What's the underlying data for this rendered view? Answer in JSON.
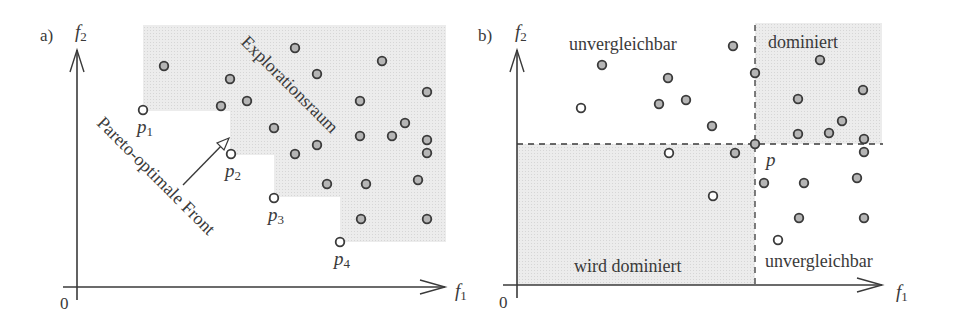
{
  "panel_a": {
    "label": "a)",
    "y_axis_label": "f",
    "y_axis_sub": "2",
    "x_axis_label": "f",
    "x_axis_sub": "1",
    "origin_label": "0",
    "region_label": "Explorationsraum",
    "front_label": "Pareto-optimale Front",
    "pareto_points": [
      {
        "name": "p",
        "sub": "1",
        "x": 143,
        "y": 110
      },
      {
        "name": "p",
        "sub": "2",
        "x": 231,
        "y": 154
      },
      {
        "name": "p",
        "sub": "3",
        "x": 274,
        "y": 198
      },
      {
        "name": "p",
        "sub": "4",
        "x": 340,
        "y": 242
      }
    ],
    "explored_points": [
      [
        164,
        66
      ],
      [
        295,
        48
      ],
      [
        230,
        79
      ],
      [
        317,
        74
      ],
      [
        382,
        61
      ],
      [
        427,
        92
      ],
      [
        221,
        106
      ],
      [
        247,
        101
      ],
      [
        360,
        101
      ],
      [
        274,
        128
      ],
      [
        295,
        154
      ],
      [
        317,
        145
      ],
      [
        360,
        136
      ],
      [
        392,
        136
      ],
      [
        405,
        123
      ],
      [
        427,
        140
      ],
      [
        427,
        153
      ],
      [
        327,
        184
      ],
      [
        366,
        184
      ],
      [
        418,
        180
      ],
      [
        361,
        219
      ],
      [
        427,
        219
      ]
    ]
  },
  "panel_b": {
    "label": "b)",
    "y_axis_label": "f",
    "y_axis_sub": "2",
    "x_axis_label": "f",
    "x_axis_sub": "1",
    "origin_label": "0",
    "reference_point_label": "p",
    "region_labels": {
      "top_left": "unvergleichbar",
      "top_right": "dominiert",
      "bottom_left": "wird dominiert",
      "bottom_right": "unvergleichbar"
    },
    "reference_point": [
      755,
      144
    ],
    "filled_points": [
      [
        602,
        65
      ],
      [
        668,
        78
      ],
      [
        659,
        104
      ],
      [
        686,
        100
      ],
      [
        712,
        126
      ],
      [
        733,
        46
      ],
      [
        755,
        73
      ],
      [
        735,
        153
      ],
      [
        798,
        99
      ],
      [
        820,
        60
      ],
      [
        863,
        90
      ],
      [
        842,
        121
      ],
      [
        798,
        134
      ],
      [
        829,
        133
      ],
      [
        864,
        139
      ],
      [
        864,
        152
      ],
      [
        764,
        183
      ],
      [
        804,
        183
      ],
      [
        857,
        178
      ],
      [
        799,
        218
      ],
      [
        864,
        218
      ]
    ],
    "open_points": [
      [
        581,
        108
      ],
      [
        669,
        153
      ],
      [
        713,
        196
      ],
      [
        778,
        240
      ]
    ]
  },
  "colors": {
    "shade": "#e6e6e6",
    "ink": "#3a3a3a",
    "point_fill": "#b5b5b5"
  },
  "chart_data": [
    {
      "type": "scatter",
      "title": "a) Pareto-optimale Front und Explorationsraum",
      "xlabel": "f1",
      "ylabel": "f2",
      "annotations": [
        "Explorationsraum",
        "Pareto-optimale Front",
        "p1",
        "p2",
        "p3",
        "p4",
        "0"
      ],
      "series": [
        {
          "name": "Pareto-optimal (open)",
          "points": [
            [
              "p1",
              143,
              110
            ],
            [
              "p2",
              231,
              154
            ],
            [
              "p3",
              274,
              198
            ],
            [
              "p4",
              340,
              242
            ]
          ]
        },
        {
          "name": "Explorationsraum (filled)",
          "count": 22
        }
      ]
    },
    {
      "type": "scatter",
      "title": "b) Dominanzbereiche bezüglich p",
      "xlabel": "f1",
      "ylabel": "f2",
      "regions": [
        "unvergleichbar (oben links)",
        "dominiert (oben rechts)",
        "wird dominiert (unten links)",
        "unvergleichbar (unten rechts)"
      ],
      "series": [
        {
          "name": "filled points",
          "count": 21
        },
        {
          "name": "open points",
          "count": 4
        }
      ]
    }
  ]
}
